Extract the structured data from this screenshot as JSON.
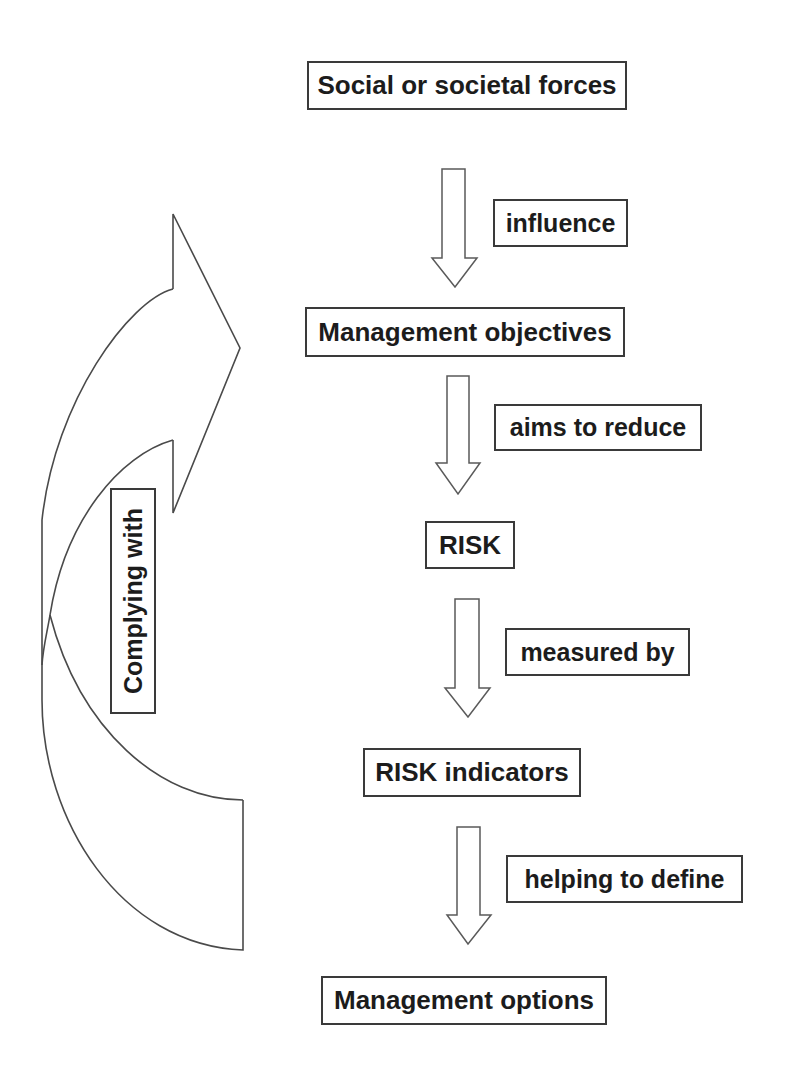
{
  "diagram": {
    "nodes": [
      {
        "id": "social-forces",
        "label": "Social or societal forces"
      },
      {
        "id": "management-objectives",
        "label": "Management objectives"
      },
      {
        "id": "risk",
        "label": "RISK"
      },
      {
        "id": "risk-indicators",
        "label": "RISK indicators"
      },
      {
        "id": "management-options",
        "label": "Management options"
      }
    ],
    "edges": [
      {
        "from": "social-forces",
        "to": "management-objectives",
        "label": "influence"
      },
      {
        "from": "management-objectives",
        "to": "risk",
        "label": "aims to reduce"
      },
      {
        "from": "risk",
        "to": "risk-indicators",
        "label": "measured by"
      },
      {
        "from": "risk-indicators",
        "to": "management-options",
        "label": "helping to define"
      }
    ],
    "feedback": {
      "from": "management-options",
      "to": "management-objectives",
      "label": "Complying with",
      "shape": "curved-right-arrow"
    },
    "colors": {
      "line": "#3a3a3a",
      "text": "#1c1c1c",
      "background": "#ffffff"
    }
  }
}
